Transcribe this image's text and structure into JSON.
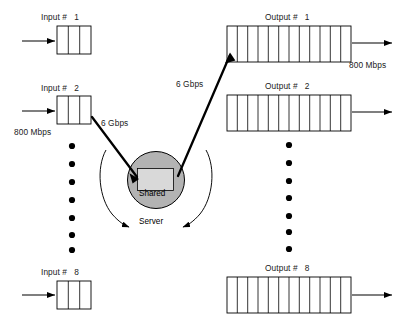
{
  "diagram": {
    "server": {
      "label_line1": "Shared",
      "label_line2": "Server",
      "fill_color": "#b3b3b3",
      "stroke_color": "#000000"
    },
    "inputs": [
      {
        "label": "Input #   1",
        "cells": 3,
        "rate": null
      },
      {
        "label": "Input #   2",
        "cells": 3,
        "rate": "800 Mbps"
      },
      {
        "label": "Input #   8",
        "cells": 3,
        "rate": null
      }
    ],
    "outputs": [
      {
        "label": "Output #   1",
        "cells": 12,
        "rate": "800 Mbps"
      },
      {
        "label": "Output #   2",
        "cells": 12,
        "rate": null
      },
      {
        "label": "Output #   8",
        "cells": 12,
        "rate": null
      }
    ],
    "link_rates": {
      "input_to_server": "6 Gbps",
      "server_to_output": "6 Gbps"
    },
    "ellipsis": {
      "left_dot_count": 7,
      "right_dot_count": 7,
      "dot_color": "#000000"
    },
    "colors": {
      "line": "#000000",
      "box_stroke": "#000000",
      "text": "#1a1a1a",
      "background": "#ffffff"
    }
  }
}
